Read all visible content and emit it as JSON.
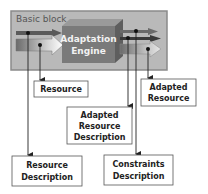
{
  "diagram": {
    "container": {
      "label": "Basic block"
    },
    "engine": {
      "line1": "Adaptation",
      "line2": "Engine"
    },
    "boxes": {
      "resource": {
        "line1": "Resource"
      },
      "adapted_resource": {
        "line1": "Adapted",
        "line2": "Resource"
      },
      "adapted_resource_description": {
        "line1": "Adapted",
        "line2": "Resource",
        "line3": "Description"
      },
      "resource_description": {
        "line1": "Resource",
        "line2": "Description"
      },
      "constraints_description": {
        "line1": "Constraints",
        "line2": "Description"
      }
    },
    "colors": {
      "container_fill": "#b9b9b9",
      "container_border": "#8a8a8a",
      "engine_front": "#7a7a7a",
      "engine_top": "#9a9a9a",
      "engine_side": "#5e5e5e",
      "line": "#222222"
    }
  }
}
